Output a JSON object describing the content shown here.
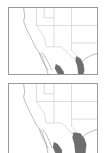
{
  "figure": {
    "panels": [
      {
        "id": "map-top",
        "region": "Southwestern United States and northern Mexico",
        "range_color": "#6e6e6e"
      },
      {
        "id": "map-bottom",
        "region": "Southwestern United States and northern Mexico",
        "range_color": "#6e6e6e"
      }
    ]
  }
}
